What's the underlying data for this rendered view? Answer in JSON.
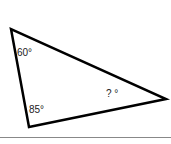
{
  "diagram": {
    "type": "triangle",
    "vertices": {
      "top_left": [
        11,
        29
      ],
      "bottom": [
        29,
        127
      ],
      "right": [
        166,
        99
      ]
    },
    "angles": [
      {
        "vertex": "top_left",
        "label": "60°"
      },
      {
        "vertex": "bottom",
        "label": "85°"
      },
      {
        "vertex": "right",
        "label": "? °"
      }
    ],
    "stroke_color": "#000000",
    "baseline_color": "#888888"
  }
}
